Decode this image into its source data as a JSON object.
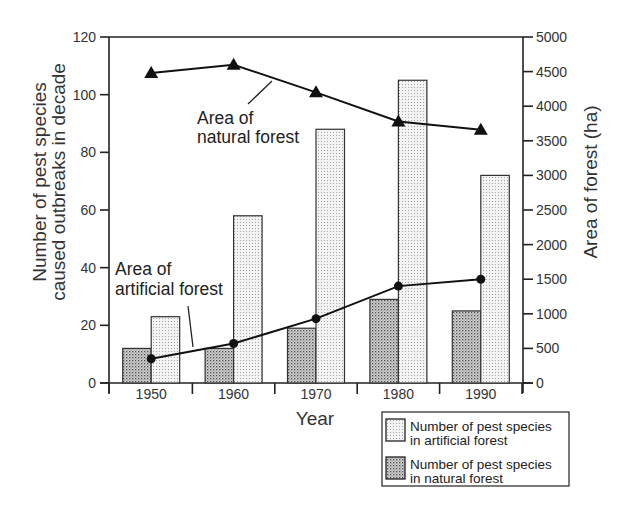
{
  "chart_data": {
    "type": "bar+line",
    "title": "",
    "categories": [
      "1950",
      "1960",
      "1970",
      "1980",
      "1990"
    ],
    "xlabel": "Year",
    "ylabel": "Number of pest species caused outbreaks in decade",
    "ylabel_lines": [
      "Number of pest species",
      "caused outbreaks in decade"
    ],
    "ylim": [
      0,
      120
    ],
    "yticks": [
      0,
      20,
      40,
      60,
      80,
      100,
      120
    ],
    "y2label": "Area of forest (ha)",
    "y2lim": [
      0,
      5000
    ],
    "y2ticks": [
      0,
      500,
      1000,
      1500,
      2000,
      2500,
      3000,
      3500,
      4000,
      4500,
      5000
    ],
    "grid": false,
    "legend_position": "bottom-right (outside plot)",
    "series": [
      {
        "name": "Number of pest species in natural forest",
        "type": "bar",
        "axis": "left",
        "pattern": "dense-dots",
        "values": [
          12,
          12,
          19,
          29,
          25
        ]
      },
      {
        "name": "Number of pest species in artificial forest",
        "type": "bar",
        "axis": "left",
        "pattern": "light-dots",
        "values": [
          23,
          58,
          88,
          105,
          72
        ]
      },
      {
        "name": "Area of natural forest",
        "type": "line",
        "axis": "right",
        "marker": "triangle",
        "values": [
          4480,
          4600,
          4200,
          3780,
          3660
        ]
      },
      {
        "name": "Area of artificial forest",
        "type": "line",
        "axis": "right",
        "marker": "circle",
        "values": [
          350,
          570,
          930,
          1400,
          1500
        ]
      }
    ],
    "annotations": [
      {
        "lines": [
          "Area of",
          "natural forest"
        ],
        "points_to": "Area of natural forest"
      },
      {
        "lines": [
          "Area of",
          "artificial forest"
        ],
        "points_to": "Area of artificial forest"
      }
    ],
    "legend": [
      {
        "lines": [
          "Number of pest species",
          "in artificial forest"
        ],
        "pattern": "light-dots"
      },
      {
        "lines": [
          "Number of pest species",
          "in natural forest"
        ],
        "pattern": "dense-dots"
      }
    ]
  },
  "colors": {
    "axis": "#222222",
    "line": "#111111",
    "natural_bar_bg": "#d8d8d8",
    "natural_bar_dot": "#555555",
    "artificial_bar_bg": "#f2f2f2",
    "artificial_bar_dot": "#9a9a9a"
  }
}
